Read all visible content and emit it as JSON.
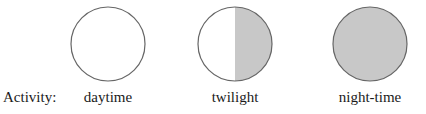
{
  "row_label": "Activity:",
  "phases": [
    {
      "label": "daytime",
      "fill": "none"
    },
    {
      "label": "twilight",
      "fill": "half"
    },
    {
      "label": "night-time",
      "fill": "full"
    }
  ],
  "colors": {
    "outline": "#666666",
    "shade": "#c8c8c8",
    "background": "#ffffff"
  }
}
